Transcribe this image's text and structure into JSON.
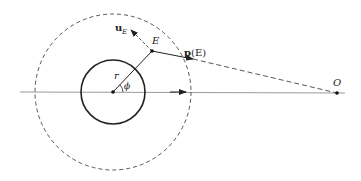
{
  "diagram": {
    "colors": {
      "stroke": "#222222",
      "axis": "#9a9a9a",
      "dashed": "#555555"
    },
    "labels": {
      "u_E": "u",
      "u_E_sub": "E",
      "E": "E",
      "pE_bold": "p",
      "pE_arg": "(E)",
      "r": "r",
      "phi": "ϕ",
      "O": "O"
    },
    "geometry": {
      "center": [
        113,
        92
      ],
      "inner_circle_radius": 32,
      "outer_dashed_circle_radius": 78,
      "point_E": [
        152,
        51
      ],
      "point_O": [
        337,
        93
      ],
      "axis_start_x": 20,
      "axis_end_x": 345
    }
  }
}
